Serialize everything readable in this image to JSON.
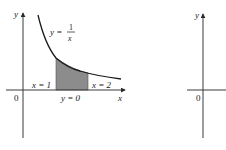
{
  "colors": {
    "axis": "#3a3a3a",
    "curve": "#1a1a1a",
    "shade": "#8c8c8c",
    "background": "#ffffff"
  },
  "left_plot": {
    "y_axis_label": "y",
    "x_axis_label": "x",
    "origin_label": "0",
    "curve_label": {
      "lhs": "y =",
      "numerator": "1",
      "denominator": "x"
    },
    "boundary_labels": {
      "left": "x = 1",
      "right": "x = 2",
      "bottom": "y = 0"
    },
    "shaded_region": {
      "function": "1/x",
      "x_from": 1,
      "x_to": 2
    }
  },
  "right_plot": {
    "y_axis_label": "y",
    "origin_label": "0"
  }
}
